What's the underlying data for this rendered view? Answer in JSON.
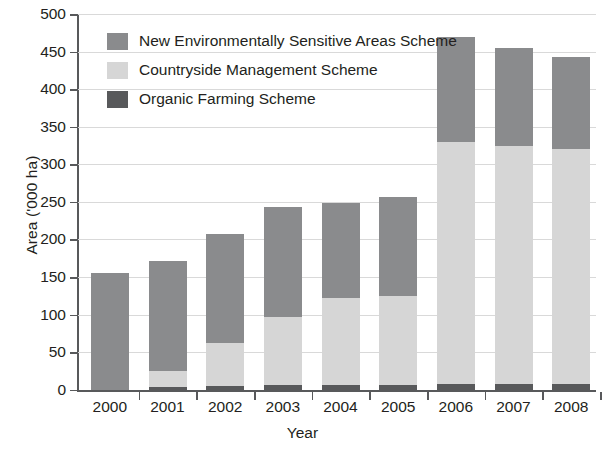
{
  "chart_data": {
    "type": "bar",
    "subtype": "stacked-bar",
    "title": "",
    "xlabel": "Year",
    "ylabel": "Area ('000 ha)",
    "categories": [
      "2000",
      "2001",
      "2002",
      "2003",
      "2004",
      "2005",
      "2006",
      "2007",
      "2008"
    ],
    "ylim": [
      0,
      500
    ],
    "yticks": [
      0,
      50,
      100,
      150,
      200,
      250,
      300,
      350,
      400,
      450,
      500
    ],
    "ytick_labels": [
      "0",
      "50",
      "100",
      "150",
      "200",
      "250",
      "300",
      "350",
      "400",
      "450",
      "500"
    ],
    "grid": true,
    "grid_axis": "y",
    "legend_position": "inside-top-left",
    "stack_order_bottom_to_top": [
      "Organic Farming Scheme",
      "Countryside Management Scheme",
      "New Environmentally Sensitive Areas Scheme"
    ],
    "series": [
      {
        "name": "New Environmentally Sensitive Areas Scheme",
        "color": "#8a8b8d",
        "values": [
          155,
          146,
          145,
          146,
          126,
          131,
          139,
          130,
          122
        ]
      },
      {
        "name": "Countryside Management Scheme",
        "color": "#d6d6d6",
        "values": [
          0,
          21,
          57,
          91,
          116,
          118,
          322,
          317,
          313
        ]
      },
      {
        "name": "Organic Farming Scheme",
        "color": "#58595b",
        "values": [
          0,
          4,
          5,
          6,
          6,
          7,
          8,
          8,
          8
        ]
      }
    ],
    "totals": [
      155,
      171,
      207,
      243,
      248,
      256,
      469,
      455,
      443
    ]
  },
  "legend": {
    "items": [
      {
        "label": "New Environmentally Sensitive Areas Scheme",
        "color": "#8a8b8d"
      },
      {
        "label": "Countryside Management Scheme",
        "color": "#d6d6d6"
      },
      {
        "label": "Organic Farming Scheme",
        "color": "#58595b"
      }
    ]
  },
  "axes": {
    "y_title": "Area ('000 ha)",
    "x_title": "Year"
  }
}
